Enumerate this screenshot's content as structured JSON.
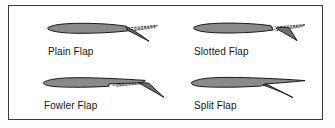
{
  "figure": {
    "name": "airfoil-flap-types",
    "border_color": "#3a3a3a",
    "background_color": "#ffffff",
    "airfoil_fill": "#8a8a8a",
    "airfoil_stroke": "#1a1a1a",
    "flap_fill": "#6f6f6f",
    "dotted_stroke": "#1a1a1a",
    "label_color": "#141414"
  },
  "panels": [
    {
      "id": "plain-flap",
      "label": "Plain Flap",
      "description": "Airfoil with hinged trailing edge deflected downward; dotted lines show the undeflected position."
    },
    {
      "id": "slotted-flap",
      "label": "Slotted Flap",
      "description": "Airfoil with trailing edge flap deflected down and separated by a slot; dotted lines show the undeflected position."
    },
    {
      "id": "fowler-flap",
      "label": "Fowler Flap",
      "description": "Airfoil with flap translated aft on tracks and deflected down; dotted lines show the retracted position."
    },
    {
      "id": "split-flap",
      "label": "Split Flap",
      "description": "Airfoil with lower surface panel deflected downward while the upper surface stays fixed."
    }
  ]
}
